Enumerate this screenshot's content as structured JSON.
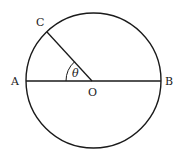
{
  "diagram": {
    "type": "circle-geometry",
    "stroke_color": "#1a1a1a",
    "background": "#ffffff",
    "circle": {
      "cx": 93.5,
      "cy": 80.5,
      "r": 67.5
    },
    "points": {
      "A": {
        "label": "A",
        "x": 26,
        "y": 81
      },
      "B": {
        "label": "B",
        "x": 161,
        "y": 81
      },
      "O": {
        "label": "O",
        "x": 92,
        "y": 81
      },
      "C": {
        "label": "C",
        "x": 47,
        "y": 32
      }
    },
    "segments": [
      {
        "name": "diameter-AB",
        "from": "A",
        "to": "B"
      },
      {
        "name": "radius-OC",
        "from": "O",
        "to": "C"
      }
    ],
    "angle": {
      "label": "θ",
      "vertex": "O",
      "between": [
        "A",
        "C"
      ]
    }
  }
}
